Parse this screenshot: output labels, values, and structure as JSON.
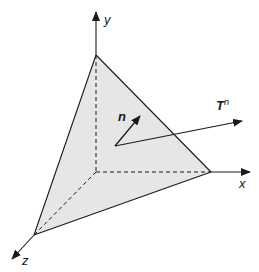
{
  "diagram": {
    "axes": {
      "x": {
        "label": "x"
      },
      "y": {
        "label": "y"
      },
      "z": {
        "label": "z"
      }
    },
    "vectors": {
      "normal": {
        "label": "n"
      },
      "traction": {
        "label": "T",
        "superscript": "n"
      }
    },
    "colors": {
      "face_fill": "#e6e6e6",
      "stroke": "#1a1a1a"
    }
  }
}
